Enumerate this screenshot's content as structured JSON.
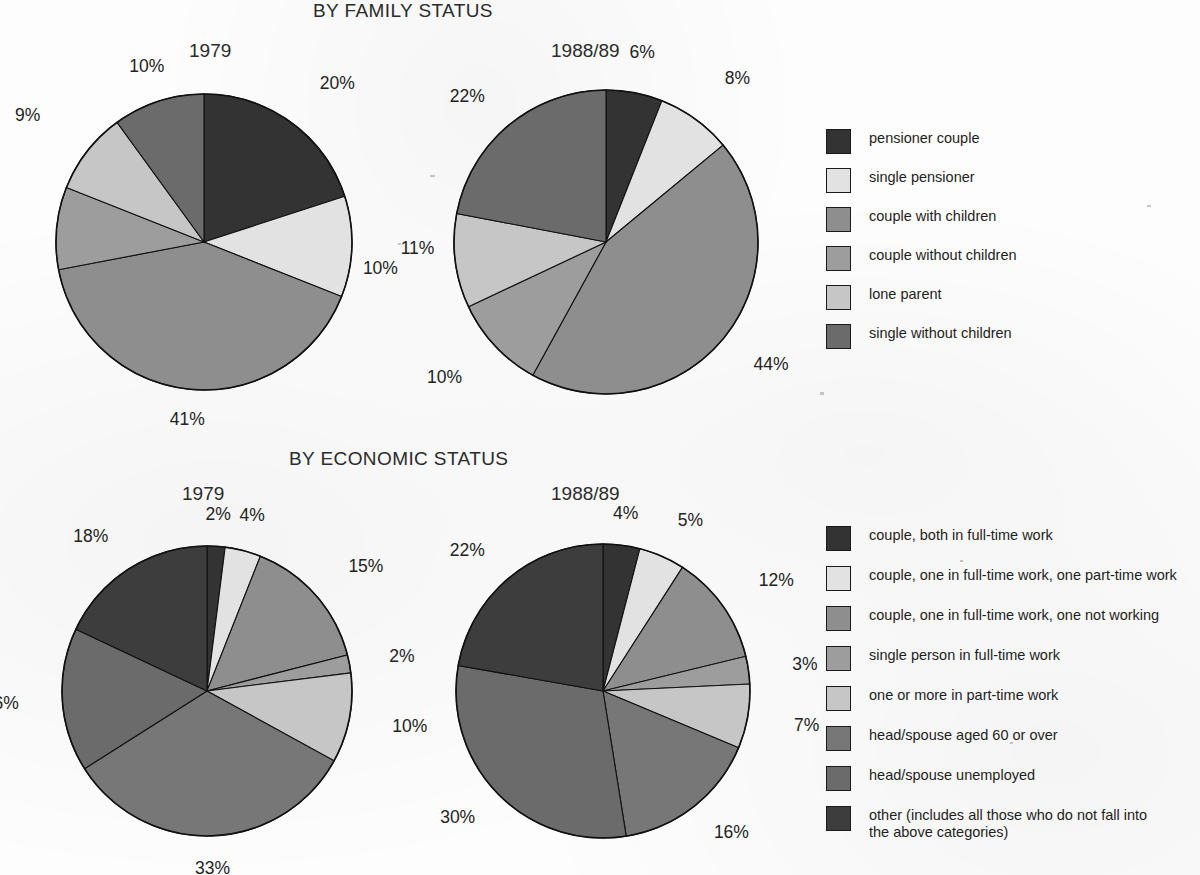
{
  "palette": {
    "ink": "#1c1c1c",
    "paper": "#fdfdfd",
    "g1": "#333333",
    "g2": "#e2e2e2",
    "g3": "#8e8e8e",
    "g4": "#9d9d9d",
    "g5": "#c6c6c6",
    "g6": "#6b6b6b",
    "g7": "#5a5a5a",
    "g8": "#3d3d3d"
  },
  "sections": [
    {
      "title": "BY FAMILY STATUS",
      "charts": [
        {
          "year": "1979"
        },
        {
          "year": "1988/89"
        }
      ],
      "legend": [
        {
          "label": "pensioner couple",
          "color": "#333333"
        },
        {
          "label": "single pensioner",
          "color": "#e2e2e2"
        },
        {
          "label": "couple with children",
          "color": "#8e8e8e"
        },
        {
          "label": "couple without children",
          "color": "#9d9d9d"
        },
        {
          "label": "lone parent",
          "color": "#c6c6c6"
        },
        {
          "label": "single without children",
          "color": "#6b6b6b"
        }
      ]
    },
    {
      "title": "BY ECONOMIC STATUS",
      "charts": [
        {
          "year": "1979"
        },
        {
          "year": "1988/89"
        }
      ],
      "legend": [
        {
          "label": "couple, both in full-time work",
          "color": "#333333"
        },
        {
          "label": "couple, one in full-time work, one part-time work",
          "color": "#e2e2e2"
        },
        {
          "label": "couple, one in full-time work, one not working",
          "color": "#8e8e8e"
        },
        {
          "label": "single person in full-time work",
          "color": "#9d9d9d"
        },
        {
          "label": "one or more in part-time work",
          "color": "#c6c6c6"
        },
        {
          "label": "head/spouse aged 60 or over",
          "color": "#777777"
        },
        {
          "label": "head/spouse unemployed",
          "color": "#6b6b6b"
        },
        {
          "label": "other (includes all those who do not fall into\nthe above categories)",
          "color": "#3d3d3d"
        }
      ]
    }
  ],
  "chart_data": [
    {
      "type": "pie",
      "title": "BY FAMILY STATUS",
      "subtitle": "1979",
      "id": "family-1979",
      "start_angle": 0,
      "direction": "clockwise",
      "unit": "%",
      "categories": [
        "pensioner couple",
        "single pensioner",
        "couple with children",
        "couple without children",
        "lone parent",
        "single without children"
      ],
      "values": [
        20,
        11,
        41,
        9,
        9,
        10
      ],
      "labels": [
        "20%",
        "11%",
        "41%",
        "9%",
        "9%",
        "10%"
      ],
      "colors": [
        "#333333",
        "#e2e2e2",
        "#8e8e8e",
        "#9d9d9d",
        "#c6c6c6",
        "#6b6b6b"
      ],
      "label_radius": [
        1.33,
        1.33,
        1.2,
        1.45,
        1.4,
        1.25
      ],
      "geometry": {
        "cx": 204,
        "cy": 242,
        "r": 148
      }
    },
    {
      "type": "pie",
      "title": "BY FAMILY STATUS",
      "subtitle": "1988/89",
      "id": "family-1988",
      "start_angle": 0,
      "direction": "clockwise",
      "unit": "%",
      "categories": [
        "pensioner couple",
        "single pensioner",
        "couple with children",
        "couple without children",
        "lone parent",
        "single without children"
      ],
      "values": [
        6,
        8,
        44,
        10,
        10,
        22
      ],
      "labels": [
        "6%",
        "8%",
        "44%",
        "10%",
        "10%",
        "22%"
      ],
      "colors": [
        "#333333",
        "#e2e2e2",
        "#8e8e8e",
        "#9d9d9d",
        "#c6c6c6",
        "#6b6b6b"
      ],
      "label_radius": [
        1.27,
        1.33,
        1.26,
        1.3,
        1.38,
        1.25
      ],
      "geometry": {
        "cx": 606,
        "cy": 242,
        "r": 152
      }
    },
    {
      "type": "pie",
      "title": "BY ECONOMIC STATUS",
      "subtitle": "1979",
      "id": "economic-1979",
      "start_angle": 0,
      "direction": "clockwise",
      "unit": "%",
      "categories": [
        "couple, both in full-time work",
        "couple, one in full-time work, one part-time work",
        "couple, one in full-time work, one not working",
        "single person in full-time work",
        "one or more in part-time work",
        "head/spouse aged 60 or over",
        "head/spouse unemployed",
        "other (includes all those who do not fall into the above categories)"
      ],
      "values": [
        2,
        4,
        15,
        2,
        10,
        33,
        16,
        18
      ],
      "labels": [
        "2%",
        "4%",
        "15%",
        "2%",
        "10%",
        "33%",
        "16%",
        "18%"
      ],
      "colors": [
        "#333333",
        "#e2e2e2",
        "#8e8e8e",
        "#9d9d9d",
        "#c6c6c6",
        "#777777",
        "#6b6b6b",
        "#3d3d3d"
      ],
      "label_radius": [
        1.22,
        1.25,
        1.3,
        1.28,
        1.3,
        1.22,
        1.3,
        1.27
      ],
      "geometry": {
        "cx": 207,
        "cy": 691,
        "r": 145
      }
    },
    {
      "type": "pie",
      "title": "BY ECONOMIC STATUS",
      "subtitle": "1988/89",
      "id": "economic-1988",
      "start_angle": 0,
      "direction": "clockwise",
      "unit": "%",
      "categories": [
        "couple, both in full-time work",
        "couple, one in full-time work, one part-time work",
        "couple, one in full-time work, one not working",
        "single person in full-time work",
        "one or more in part-time work",
        "head/spouse aged 60 or over",
        "head/spouse unemployed",
        "other (includes all those who do not fall into the above categories)"
      ],
      "values": [
        4,
        5,
        12,
        3,
        7,
        16,
        30,
        22
      ],
      "labels": [
        "4%",
        "5%",
        "12%",
        "3%",
        "7%",
        "16%",
        "30%",
        "22%"
      ],
      "colors": [
        "#333333",
        "#e2e2e2",
        "#8e8e8e",
        "#9d9d9d",
        "#c6c6c6",
        "#777777",
        "#6b6b6b",
        "#3d3d3d"
      ],
      "label_radius": [
        1.22,
        1.27,
        1.3,
        1.3,
        1.32,
        1.22,
        1.22,
        1.25
      ],
      "geometry": {
        "cx": 603,
        "cy": 691,
        "r": 147
      }
    }
  ]
}
